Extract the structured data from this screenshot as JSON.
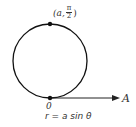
{
  "diagram": {
    "equation": "r = a sin θ",
    "top_point": {
      "r": "a",
      "theta_num": "π",
      "theta_den": "2",
      "open": "(a,",
      "close": ")"
    },
    "origin_label": "0",
    "polar_axis_label": "A",
    "colors": {
      "stroke": "#111111",
      "text": "#333333",
      "background": "#ffffff"
    }
  }
}
